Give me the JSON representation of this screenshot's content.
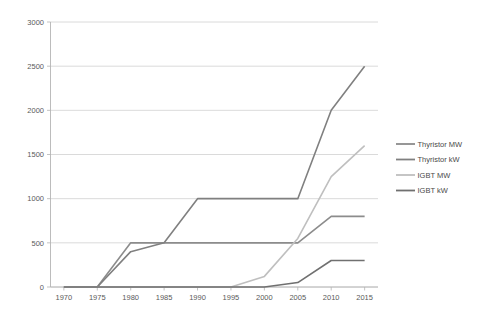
{
  "chart_data": {
    "type": "line",
    "title": "",
    "subtitle": "",
    "xlabel": "",
    "ylabel": "",
    "x": [
      1970,
      1975,
      1980,
      1985,
      1990,
      1995,
      2000,
      2005,
      2010,
      2015
    ],
    "xlim": [
      1968,
      2017
    ],
    "ylim": [
      0,
      3000
    ],
    "xticks": [
      "1970",
      "1975",
      "1980",
      "1985",
      "1990",
      "1995",
      "2000",
      "2005",
      "2010",
      "2015"
    ],
    "yticks": [
      "0",
      "500",
      "1000",
      "1500",
      "2000",
      "2500",
      "3000"
    ],
    "grid": "horizontal",
    "legend_position": "right",
    "series": [
      {
        "name": "Thyristor MW",
        "color": "#8c8c8c",
        "values": [
          0,
          0,
          500,
          500,
          500,
          500,
          500,
          500,
          800,
          800
        ]
      },
      {
        "name": "Thyristor kW",
        "color": "#808080",
        "values": [
          0,
          0,
          400,
          500,
          1000,
          1000,
          1000,
          1000,
          2000,
          2500
        ]
      },
      {
        "name": "IGBT MW",
        "color": "#bfbfbf",
        "values": [
          0,
          0,
          0,
          0,
          0,
          0,
          120,
          550,
          1250,
          1600
        ]
      },
      {
        "name": "IGBT kW",
        "color": "#707070",
        "values": [
          0,
          0,
          0,
          0,
          0,
          0,
          0,
          50,
          300,
          300
        ]
      }
    ]
  },
  "legend": {
    "items": [
      {
        "label": "Thyristor MW"
      },
      {
        "label": "Thyristor kW"
      },
      {
        "label": "IGBT MW"
      },
      {
        "label": "IGBT kW"
      }
    ]
  }
}
